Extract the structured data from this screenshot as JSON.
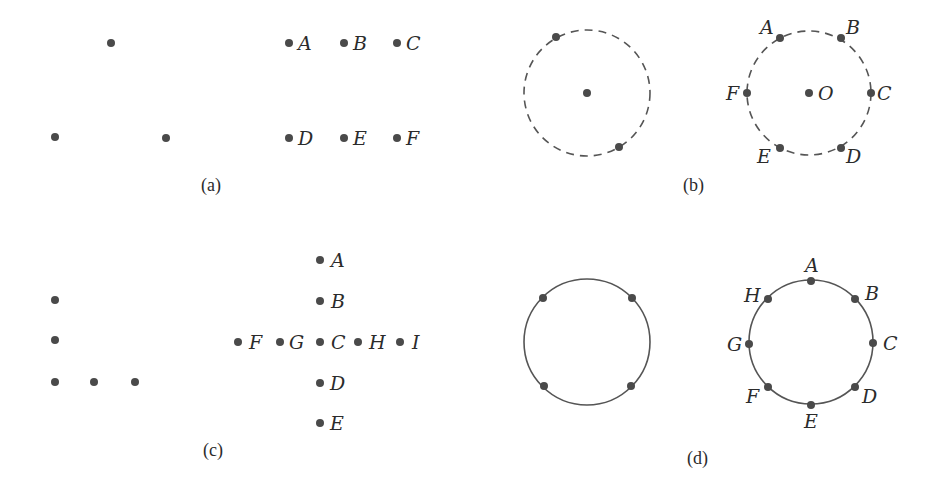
{
  "colors": {
    "ink": "#4a4a4a",
    "background": "#ffffff"
  },
  "panels": {
    "a": {
      "caption": "(a)",
      "unlabeled_dots": [
        [
          111,
          43
        ],
        [
          55,
          137
        ],
        [
          166,
          138
        ]
      ],
      "labeled_dots": [
        {
          "label": "A",
          "x": 289,
          "y": 43
        },
        {
          "label": "B",
          "x": 344,
          "y": 43
        },
        {
          "label": "C",
          "x": 397,
          "y": 43
        },
        {
          "label": "D",
          "x": 289,
          "y": 138
        },
        {
          "label": "E",
          "x": 344,
          "y": 138
        },
        {
          "label": "F",
          "x": 397,
          "y": 138
        }
      ]
    },
    "b": {
      "caption": "(b)",
      "left_circle": {
        "cx": 587,
        "cy": 93,
        "r": 63,
        "style": "dashed"
      },
      "left_dots": [
        [
          587,
          93
        ],
        [
          556,
          37
        ],
        [
          619,
          147
        ]
      ],
      "right_circle": {
        "cx": 809,
        "cy": 93,
        "r": 62,
        "style": "dashed"
      },
      "labeled_dots": [
        {
          "label": "A",
          "x": 780,
          "y": 38
        },
        {
          "label": "B",
          "x": 841,
          "y": 38
        },
        {
          "label": "C",
          "x": 871,
          "y": 93
        },
        {
          "label": "D",
          "x": 841,
          "y": 148
        },
        {
          "label": "E",
          "x": 780,
          "y": 148
        },
        {
          "label": "F",
          "x": 747,
          "y": 93
        },
        {
          "label": "O",
          "x": 809,
          "y": 93
        }
      ]
    },
    "c": {
      "caption": "(c)",
      "unlabeled_dots": [
        [
          55,
          300
        ],
        [
          55,
          340
        ],
        [
          55,
          382
        ],
        [
          94,
          382
        ],
        [
          135,
          382
        ]
      ],
      "labeled_dots": [
        {
          "label": "A",
          "x": 320,
          "y": 260
        },
        {
          "label": "B",
          "x": 320,
          "y": 301
        },
        {
          "label": "C",
          "x": 320,
          "y": 342
        },
        {
          "label": "D",
          "x": 320,
          "y": 383
        },
        {
          "label": "E",
          "x": 320,
          "y": 423
        },
        {
          "label": "F",
          "x": 238,
          "y": 342
        },
        {
          "label": "G",
          "x": 280,
          "y": 342
        },
        {
          "label": "H",
          "x": 358,
          "y": 342
        },
        {
          "label": "I",
          "x": 400,
          "y": 342
        }
      ]
    },
    "d": {
      "caption": "(d)",
      "left_circle": {
        "cx": 587,
        "cy": 342,
        "r": 63,
        "style": "solid"
      },
      "left_dots": [
        [
          543,
          298
        ],
        [
          632,
          298
        ],
        [
          544,
          386
        ],
        [
          631,
          386
        ]
      ],
      "right_circle": {
        "cx": 811,
        "cy": 342,
        "r": 62,
        "style": "solid"
      },
      "labeled_dots": [
        {
          "label": "A",
          "x": 811,
          "y": 281
        },
        {
          "label": "B",
          "x": 855,
          "y": 299
        },
        {
          "label": "C",
          "x": 873,
          "y": 343
        },
        {
          "label": "D",
          "x": 855,
          "y": 387
        },
        {
          "label": "E",
          "x": 811,
          "y": 405
        },
        {
          "label": "F",
          "x": 768,
          "y": 387
        },
        {
          "label": "G",
          "x": 749,
          "y": 344
        },
        {
          "label": "H",
          "x": 768,
          "y": 299
        }
      ]
    }
  }
}
